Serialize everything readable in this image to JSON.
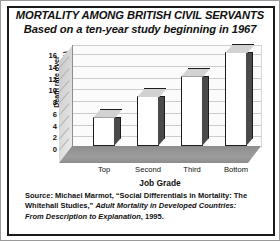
{
  "chart_data": {
    "type": "bar",
    "title": "MORTALITY AMONG BRITISH CIVIL SERVANTS",
    "subtitle": "Based on a ten-year study beginning in 1967",
    "categories": [
      "Top",
      "Second",
      "Third",
      "Bottom"
    ],
    "values": [
      5,
      8.5,
      12,
      16
    ],
    "xlabel": "Job Grade",
    "ylabel": "Death rate over 10-year period (%)",
    "ylabel_line1": "Death rate over",
    "ylabel_line2": "10-year period (%)",
    "ylim": [
      0,
      16
    ],
    "yticks": [
      16,
      14,
      12,
      10,
      8,
      6,
      4,
      2,
      0
    ],
    "grid": true,
    "legend": "none",
    "style": "3d-column",
    "colors": {
      "bar_face": "#ffffff",
      "bar_side": "#4a4a4a",
      "bar_top": "#d2d2d2",
      "bar_outline": "#1c1c1c",
      "back_wall": "#fbfbfb",
      "side_wall": "#d8d8d8",
      "floor": "#949494",
      "gridline": "#cccccc",
      "text": "#111111",
      "frame": "#1a1a1a"
    }
  },
  "source": {
    "prefix": "Source: Michael Marmot, “Social Differentials in Mortality: The Whitehall Studies,” ",
    "italic_title": "Adult Mortality in Developed Countries: From Description to Explanation",
    "suffix": ", 1995."
  }
}
